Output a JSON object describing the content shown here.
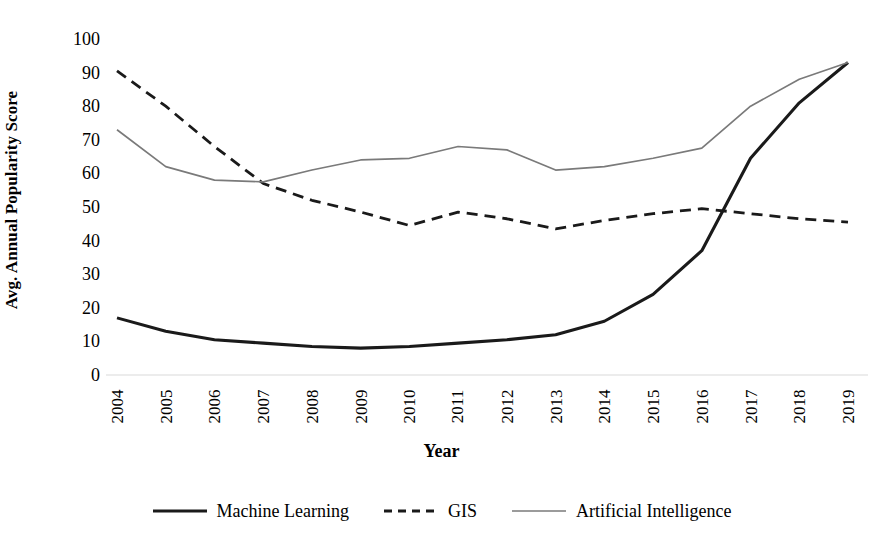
{
  "chart_data": {
    "type": "line",
    "title": "",
    "xlabel": "Year",
    "ylabel": "Avg. Annual Popularity Score",
    "xlim": [
      2004,
      2019
    ],
    "ylim": [
      0,
      100
    ],
    "grid": false,
    "legend_position": "bottom",
    "categories": [
      "2004",
      "2005",
      "2006",
      "2007",
      "2008",
      "2009",
      "2010",
      "2011",
      "2012",
      "2013",
      "2014",
      "2015",
      "2016",
      "2017",
      "2018",
      "2019"
    ],
    "y_ticks": [
      "0",
      "10",
      "20",
      "30",
      "40",
      "50",
      "60",
      "70",
      "80",
      "90",
      "100"
    ],
    "series": [
      {
        "name": "Machine Learning",
        "style": "solid",
        "color": "#1a1a1a",
        "width": 3.1,
        "values": [
          17,
          13,
          10.5,
          9.5,
          8.5,
          8,
          8.5,
          9.5,
          10.5,
          12,
          16,
          24,
          37,
          64.5,
          81,
          93
        ]
      },
      {
        "name": "GIS",
        "style": "dashed",
        "color": "#1a1a1a",
        "width": 2.8,
        "values": [
          90.5,
          80,
          68,
          57,
          52,
          48.5,
          44.5,
          48.5,
          46.5,
          43.5,
          46,
          48,
          49.5,
          48,
          46.5,
          45.5
        ]
      },
      {
        "name": "Artificial Intelligence",
        "style": "solid",
        "color": "#7a7a7a",
        "width": 1.7,
        "values": [
          73,
          62,
          58,
          57.5,
          61,
          64,
          64.5,
          68,
          67,
          61,
          62,
          64.5,
          67.5,
          80,
          88,
          93
        ]
      }
    ]
  },
  "axis": {
    "axis_line_color": "#d9d9d9"
  }
}
